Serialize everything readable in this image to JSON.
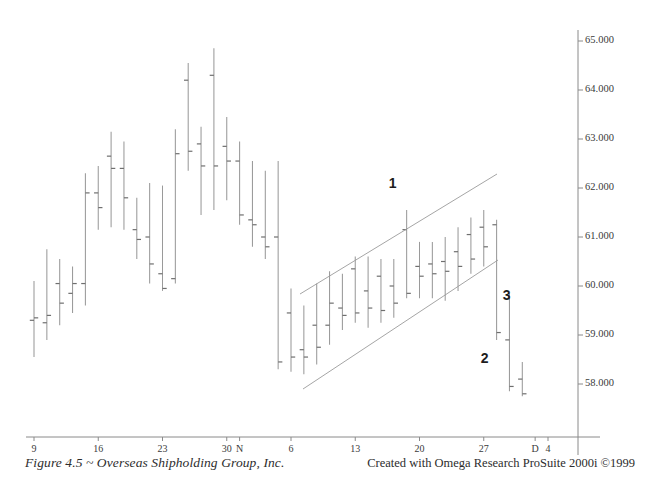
{
  "figure": {
    "caption_left": "Figure 4.5 ~ Overseas Shipholding Group, Inc.",
    "caption_right": "Created with Omega Research ProSuite 2000i ©1999"
  },
  "chart_data": {
    "type": "ohlc",
    "title": "Overseas Shipholding Group, Inc.",
    "xlabel": "",
    "ylabel": "",
    "ylim": [
      57.4,
      65.3
    ],
    "grid": false,
    "legend": null,
    "y_axis_position": "right",
    "y_ticks": [
      "65.000",
      "64.000",
      "63.000",
      "62.000",
      "61.000",
      "60.000",
      "59.000",
      "58.000"
    ],
    "y_tick_values": [
      65.0,
      64.0,
      63.0,
      62.0,
      61.0,
      60.0,
      59.0,
      58.0
    ],
    "x_ticks": [
      "9",
      "16",
      "23",
      "30",
      "N",
      "6",
      "13",
      "20",
      "27",
      "D",
      "4"
    ],
    "x_tick_index": [
      0,
      5,
      10,
      15,
      16,
      20,
      25,
      30,
      35,
      39,
      40
    ],
    "bars": [
      {
        "i": 0,
        "high": 60.1,
        "low": 58.55,
        "open": 59.3,
        "close": 59.35
      },
      {
        "i": 1,
        "high": 60.75,
        "low": 58.9,
        "open": 59.25,
        "close": 59.4
      },
      {
        "i": 2,
        "high": 60.55,
        "low": 59.2,
        "open": 60.05,
        "close": 59.65
      },
      {
        "i": 3,
        "high": 60.4,
        "low": 59.45,
        "open": 59.85,
        "close": 60.05
      },
      {
        "i": 4,
        "high": 62.3,
        "low": 59.6,
        "open": 60.05,
        "close": 61.9
      },
      {
        "i": 5,
        "high": 62.45,
        "low": 61.15,
        "open": 61.9,
        "close": 61.6
      },
      {
        "i": 6,
        "high": 63.15,
        "low": 61.2,
        "open": 62.65,
        "close": 62.4
      },
      {
        "i": 7,
        "high": 62.95,
        "low": 61.15,
        "open": 62.4,
        "close": 61.8
      },
      {
        "i": 8,
        "high": 61.8,
        "low": 60.55,
        "open": 61.15,
        "close": 60.95
      },
      {
        "i": 9,
        "high": 62.1,
        "low": 60.05,
        "open": 61.0,
        "close": 60.45
      },
      {
        "i": 10,
        "high": 62.05,
        "low": 59.9,
        "open": 60.25,
        "close": 59.95
      },
      {
        "i": 11,
        "high": 63.2,
        "low": 60.05,
        "open": 60.15,
        "close": 62.7
      },
      {
        "i": 12,
        "high": 64.55,
        "low": 62.35,
        "open": 64.2,
        "close": 62.75
      },
      {
        "i": 13,
        "high": 63.25,
        "low": 61.45,
        "open": 62.9,
        "close": 62.45
      },
      {
        "i": 14,
        "high": 64.85,
        "low": 61.55,
        "open": 64.3,
        "close": 62.45
      },
      {
        "i": 15,
        "high": 63.45,
        "low": 61.75,
        "open": 62.85,
        "close": 62.55
      },
      {
        "i": 16,
        "high": 62.95,
        "low": 61.25,
        "open": 62.55,
        "close": 61.45
      },
      {
        "i": 17,
        "high": 62.55,
        "low": 60.8,
        "open": 61.35,
        "close": 61.25
      },
      {
        "i": 18,
        "high": 62.35,
        "low": 60.55,
        "open": 61.0,
        "close": 60.8
      },
      {
        "i": 19,
        "high": 62.55,
        "low": 58.3,
        "open": 61.0,
        "close": 58.45
      },
      {
        "i": 20,
        "high": 59.95,
        "low": 58.25,
        "open": 59.45,
        "close": 58.55
      },
      {
        "i": 21,
        "high": 59.6,
        "low": 58.2,
        "open": 58.7,
        "close": 58.55
      },
      {
        "i": 22,
        "high": 60.05,
        "low": 58.4,
        "open": 59.2,
        "close": 58.75
      },
      {
        "i": 23,
        "high": 60.3,
        "low": 58.8,
        "open": 59.2,
        "close": 59.65
      },
      {
        "i": 24,
        "high": 60.25,
        "low": 59.1,
        "open": 59.55,
        "close": 59.4
      },
      {
        "i": 25,
        "high": 60.6,
        "low": 59.25,
        "open": 60.35,
        "close": 59.45
      },
      {
        "i": 26,
        "high": 60.6,
        "low": 59.15,
        "open": 59.9,
        "close": 59.55
      },
      {
        "i": 27,
        "high": 60.55,
        "low": 59.25,
        "open": 60.2,
        "close": 59.5
      },
      {
        "i": 28,
        "high": 60.55,
        "low": 59.35,
        "open": 60.0,
        "close": 59.65
      },
      {
        "i": 29,
        "high": 61.55,
        "low": 59.75,
        "open": 61.15,
        "close": 59.85
      },
      {
        "i": 30,
        "high": 60.9,
        "low": 59.75,
        "open": 60.4,
        "close": 60.2
      },
      {
        "i": 31,
        "high": 60.9,
        "low": 59.75,
        "open": 60.45,
        "close": 60.25
      },
      {
        "i": 32,
        "high": 61.0,
        "low": 59.7,
        "open": 60.5,
        "close": 60.3
      },
      {
        "i": 33,
        "high": 61.2,
        "low": 59.9,
        "open": 60.7,
        "close": 60.4
      },
      {
        "i": 34,
        "high": 61.4,
        "low": 60.25,
        "open": 61.05,
        "close": 60.55
      },
      {
        "i": 35,
        "high": 61.55,
        "low": 60.4,
        "open": 61.2,
        "close": 60.8
      },
      {
        "i": 36,
        "high": 61.35,
        "low": 58.9,
        "open": 61.25,
        "close": 59.05
      },
      {
        "i": 37,
        "high": 59.85,
        "low": 57.85,
        "open": 58.9,
        "close": 57.95
      },
      {
        "i": 38,
        "high": 58.45,
        "low": 57.75,
        "open": 58.1,
        "close": 57.8
      }
    ],
    "annotations": [
      {
        "label": "1",
        "x_index": 29,
        "price": 61.55,
        "note": "breakout point above channel"
      },
      {
        "label": "2",
        "x_index": 36,
        "price": 58.8,
        "note": "break below channel"
      },
      {
        "label": "3",
        "x_index": 36,
        "price": 59.35,
        "note": "channel break target"
      }
    ],
    "trendlines": [
      {
        "name": "upper-channel-line",
        "x1": 300,
        "y1": 294,
        "x2": 497,
        "y2": 174
      },
      {
        "name": "lower-channel-line",
        "x1": 303,
        "y1": 389,
        "x2": 498,
        "y2": 260
      }
    ]
  }
}
